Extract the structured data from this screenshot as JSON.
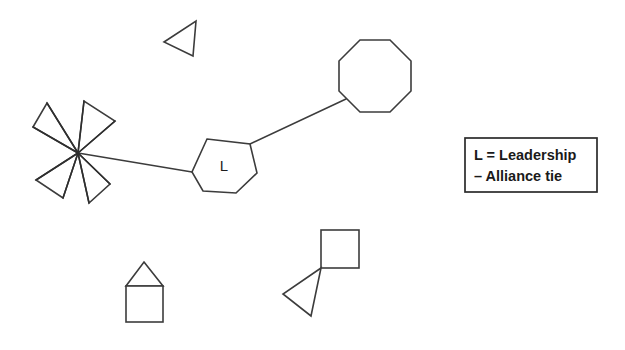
{
  "diagram": {
    "background_color": "#ffffff",
    "stroke_color": "#3c3c3c",
    "width": 625,
    "height": 350,
    "nodes": [
      {
        "id": "leadership-hexagon",
        "shape": "hexagon",
        "label": "L",
        "center": [
          224,
          166
        ],
        "radius": 33
      },
      {
        "id": "octagon-node",
        "shape": "octagon",
        "label": "",
        "center": [
          375,
          76
        ],
        "radius": 39
      },
      {
        "id": "pinwheel-cluster",
        "shape": "four-triangle-star",
        "label": "",
        "center": [
          78,
          153
        ],
        "radius": 50
      },
      {
        "id": "lone-triangle",
        "shape": "triangle",
        "label": "",
        "center": [
          184,
          39
        ],
        "radius": 20
      },
      {
        "id": "house-node",
        "shape": "square-with-roof",
        "label": "",
        "center": [
          144,
          292
        ],
        "radius": 32
      },
      {
        "id": "square-triangle-node",
        "shape": "square-with-triangle",
        "label": "",
        "center": [
          320,
          272
        ],
        "radius": 45
      }
    ],
    "edges": [
      {
        "id": "tie-hexagon-octagon",
        "from": "leadership-hexagon",
        "to": "octagon-node",
        "type": "alliance-tie"
      },
      {
        "id": "tie-pinwheel-hexagon",
        "from": "pinwheel-cluster",
        "to": "leadership-hexagon",
        "type": "alliance-tie"
      }
    ]
  },
  "legend": {
    "box": {
      "x": 465,
      "y": 138,
      "width": 132,
      "height": 54
    },
    "entries": [
      {
        "key": "L",
        "symbol": "L",
        "separator": "=",
        "label": "Leadership",
        "text": "L = Leadership"
      },
      {
        "key": "tie",
        "symbol": "–",
        "separator": "",
        "label": "Alliance tie",
        "text": "–  Alliance tie"
      }
    ],
    "line1": "L = Leadership",
    "line2": "–  Alliance tie"
  }
}
